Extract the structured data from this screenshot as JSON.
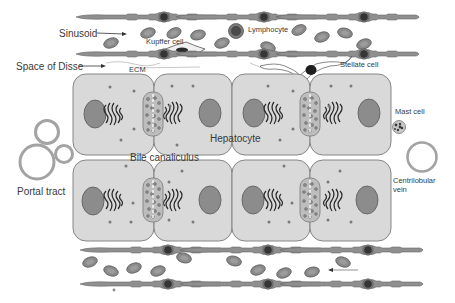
{
  "labels": {
    "sinusoid": "Sinusoid",
    "kupffer_cell": "Kupffer cell",
    "lymphocyte": "Lymphocyte",
    "space_of_disse": "Space of Disse",
    "ecm": "ECM",
    "stellate_cell": "Stellate cell",
    "mast_cell": "Mast cell",
    "hepatocyte": "Hepatocyte",
    "bile_canaliculus": "Bile canaliculus",
    "portal_tract": "Portal tract",
    "centrilobular_vein": "Centrilobular",
    "centrilobular_vein_2": "vein"
  },
  "colors": {
    "background": "#ffffff",
    "hepatocyte_fill": "#d9d9d9",
    "hepatocyte_stroke": "#7a7a7a",
    "nucleus": "#8c8c8c",
    "endothelium": "#8f8f8f",
    "endothelial_nucleus": "#3a3a3a",
    "red_blood_cell": "#8a8a8a",
    "vessel_ring": "#a3a3a3",
    "text": "#3a3a3a"
  },
  "structure": {
    "hepatocyte_rows": 2,
    "hepatocytes_per_row": 4,
    "bile_canaliculi_per_row": 2,
    "sinusoids": 2
  }
}
